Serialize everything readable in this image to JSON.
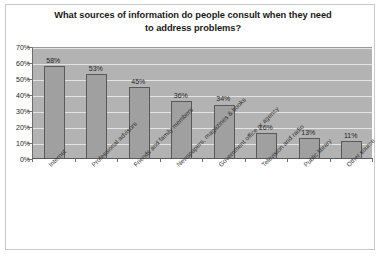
{
  "chart_data": {
    "type": "bar",
    "title": "What sources of information do people consult when they need to address problems?",
    "title_line1": "What sources of information do people consult when they need",
    "title_line2": "to address problems?",
    "xlabel": "",
    "ylabel": "",
    "ylim": [
      0,
      70
    ],
    "ytick_labels": [
      "0%",
      "10%",
      "20%",
      "30%",
      "40%",
      "50%",
      "60%",
      "70%"
    ],
    "ytick_values": [
      0,
      10,
      20,
      30,
      40,
      50,
      60,
      70
    ],
    "grid": true,
    "legend": "none",
    "categories": [
      "Internet",
      "Professional advisors",
      "Friends and family members",
      "Newspapers, magazines & books",
      "Government office or agency",
      "Television and radio",
      "Public library",
      "Other source"
    ],
    "values": [
      58,
      53,
      45,
      36,
      34,
      16,
      13,
      11
    ],
    "value_labels": [
      "58%",
      "53%",
      "45%",
      "36%",
      "34%",
      "16%",
      "13%",
      "11%"
    ],
    "colors": {
      "bar_fill": "#a0a0a0",
      "bar_border": "#595959",
      "plot_background": "#b3b3b3",
      "gridline": "#e4e4e4",
      "frame_border": "#c9c9c9",
      "page_background": "#ffffff",
      "text": "#1a1a1a"
    }
  }
}
